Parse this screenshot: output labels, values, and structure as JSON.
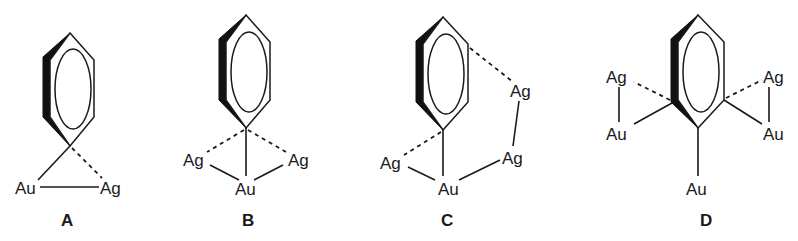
{
  "figure": {
    "structures": [
      {
        "label": "A",
        "atoms": [
          {
            "symbol": "Au",
            "x": 15,
            "y": 194
          },
          {
            "symbol": "Ag",
            "x": 100,
            "y": 194
          }
        ],
        "bonds": [
          "C-Au solid",
          "C···Ag dashed",
          "Au-Ag solid"
        ]
      },
      {
        "label": "B",
        "atoms": [
          {
            "symbol": "Ag",
            "x": 183,
            "y": 166
          },
          {
            "symbol": "Ag",
            "x": 288,
            "y": 166
          },
          {
            "symbol": "Au",
            "x": 235,
            "y": 195
          }
        ],
        "bonds": [
          "C-Au solid",
          "C···Ag dashed",
          "C···Ag dashed",
          "Ag-Au solid",
          "Au-Ag solid"
        ]
      },
      {
        "label": "C",
        "atoms": [
          {
            "symbol": "Ag",
            "x": 510,
            "y": 97
          },
          {
            "symbol": "Ag",
            "x": 380,
            "y": 169
          },
          {
            "symbol": "Ag",
            "x": 502,
            "y": 164
          },
          {
            "symbol": "Au",
            "x": 438,
            "y": 195
          }
        ],
        "bonds": [
          "C-Au solid",
          "C···Ag dashed",
          "C···Ag dashed",
          "Ag-Au solid",
          "Au-Ag solid",
          "Ag-Ag solid"
        ]
      },
      {
        "label": "D",
        "atoms": [
          {
            "symbol": "Ag",
            "x": 606,
            "y": 83
          },
          {
            "symbol": "Au",
            "x": 606,
            "y": 140
          },
          {
            "symbol": "Ag",
            "x": 763,
            "y": 83
          },
          {
            "symbol": "Au",
            "x": 763,
            "y": 140
          },
          {
            "symbol": "Au",
            "x": 690,
            "y": 195
          }
        ],
        "bonds": [
          "C-Au solid x3",
          "C···Ag dashed x2",
          "Ag-Au solid x2"
        ]
      }
    ],
    "labels": [
      "A",
      "B",
      "C",
      "D"
    ]
  }
}
